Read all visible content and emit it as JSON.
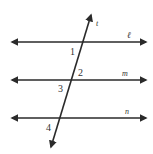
{
  "diagram": {
    "type": "parallel-lines-transversal",
    "line_color": "#2a2a2a",
    "lines": [
      {
        "id": "l",
        "label": "ℓ",
        "y": 42
      },
      {
        "id": "m",
        "label": "m",
        "y": 80
      },
      {
        "id": "n",
        "label": "n",
        "y": 118
      }
    ],
    "transversal": {
      "id": "t",
      "label": "t"
    },
    "angles": [
      {
        "label": "1"
      },
      {
        "label": "2"
      },
      {
        "label": "3"
      },
      {
        "label": "4"
      }
    ]
  }
}
